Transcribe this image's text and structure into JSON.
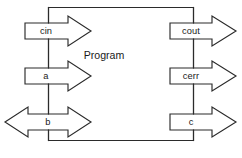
{
  "diagram": {
    "title": "Program",
    "canvas": {
      "width": 242,
      "height": 158
    },
    "colors": {
      "stroke": "#2b2b2b",
      "fill": "#ffffff",
      "text": "#1a1a1a",
      "background": "#ffffff"
    },
    "program_box": {
      "label": "Program",
      "left": 48.5,
      "right": 193.5,
      "top": 7.5,
      "bottom": 140.5,
      "label_x": 104,
      "label_y": 56
    },
    "arrows": [
      {
        "id": "cin",
        "label": "cin",
        "direction": "right",
        "side": "left",
        "body_left": 25,
        "body_right": 68,
        "tip_x": 91,
        "center_y": 31,
        "body_half_height": 8,
        "head_half_height": 15,
        "label_x": 46,
        "label_y": 31.5
      },
      {
        "id": "a",
        "label": "a",
        "direction": "right",
        "side": "left",
        "body_left": 25,
        "body_right": 68,
        "tip_x": 91,
        "center_y": 76,
        "body_half_height": 8,
        "head_half_height": 15,
        "label_x": 46,
        "label_y": 76.5
      },
      {
        "id": "b",
        "label": "b",
        "direction": "both",
        "side": "left",
        "body_left": 25,
        "body_right": 68,
        "tip_x": 91,
        "tail_tip_x": 5,
        "center_y": 122,
        "body_half_height": 8,
        "head_half_height": 15,
        "label_x": 46,
        "label_y": 122.5
      },
      {
        "id": "cout",
        "label": "cout",
        "direction": "right",
        "side": "right",
        "body_left": 170,
        "body_right": 212,
        "tip_x": 236,
        "center_y": 31,
        "body_half_height": 8,
        "head_half_height": 15,
        "label_x": 191,
        "label_y": 31.5
      },
      {
        "id": "cerr",
        "label": "cerr",
        "direction": "right",
        "side": "right",
        "body_left": 170,
        "body_right": 212,
        "tip_x": 236,
        "center_y": 76,
        "body_half_height": 8,
        "head_half_height": 15,
        "label_x": 191,
        "label_y": 76.5
      },
      {
        "id": "c",
        "label": "c",
        "direction": "right",
        "side": "right",
        "body_left": 170,
        "body_right": 212,
        "tip_x": 236,
        "center_y": 122,
        "body_half_height": 8,
        "head_half_height": 15,
        "label_x": 191,
        "label_y": 122.5
      }
    ]
  }
}
